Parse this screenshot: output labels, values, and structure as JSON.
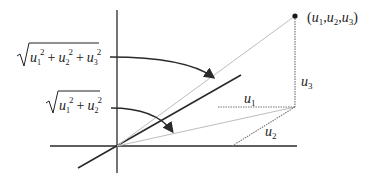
{
  "diagram": {
    "point_label": {
      "open": "(",
      "u1": "u",
      "s1": "1",
      "c1": ",",
      "u2": "u",
      "s2": "2",
      "c2": ",",
      "u3": "u",
      "s3": "3",
      "close": ")"
    },
    "labels": {
      "u1": {
        "base": "u",
        "sub": "1"
      },
      "u2": {
        "base": "u",
        "sub": "2"
      },
      "u3": {
        "base": "u",
        "sub": "3"
      }
    },
    "formula_3d": {
      "terms": [
        {
          "base": "u",
          "sub": "1",
          "sup": "2"
        },
        {
          "base": "u",
          "sub": "2",
          "sup": "2"
        },
        {
          "base": "u",
          "sub": "3",
          "sup": "2"
        }
      ],
      "plus": "+"
    },
    "formula_2d": {
      "terms": [
        {
          "base": "u",
          "sub": "1",
          "sup": "2"
        },
        {
          "base": "u",
          "sub": "2",
          "sup": "2"
        }
      ],
      "plus": "+"
    },
    "colors": {
      "axis": "#2a2a2a",
      "light_line": "#bdbdbd",
      "dotted": "#777777"
    }
  }
}
